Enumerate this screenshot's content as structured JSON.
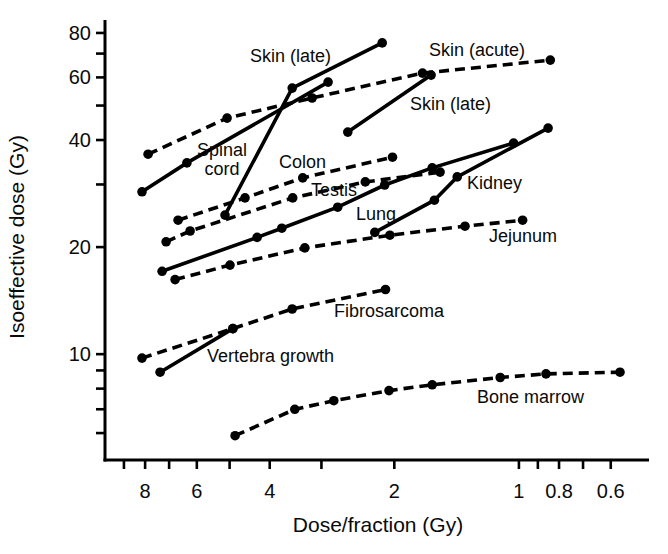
{
  "figure": {
    "background": "#ffffff",
    "ink": "#000000"
  },
  "chart_data": {
    "type": "line",
    "title": "",
    "xlabel": "Dose/fraction (Gy)",
    "ylabel": "Isoeffective dose (Gy)",
    "x_scale": "log",
    "y_scale": "log",
    "x_axis_reversed": true,
    "x_domain": [
      10,
      0.485
    ],
    "y_domain": [
      5.04,
      87.0
    ],
    "grid": false,
    "legend": "none (direct line labels)",
    "x_ticks": [
      {
        "v": 9,
        "label": ""
      },
      {
        "v": 8,
        "label": "8"
      },
      {
        "v": 7,
        "label": ""
      },
      {
        "v": 6,
        "label": "6"
      },
      {
        "v": 5,
        "label": ""
      },
      {
        "v": 4,
        "label": "4"
      },
      {
        "v": 3,
        "label": ""
      },
      {
        "v": 2,
        "label": "2"
      },
      {
        "v": 1,
        "label": "1"
      },
      {
        "v": 0.9,
        "label": ""
      },
      {
        "v": 0.8,
        "label": "0.8"
      },
      {
        "v": 0.7,
        "label": ""
      },
      {
        "v": 0.6,
        "label": "0.6"
      }
    ],
    "y_ticks": [
      {
        "v": 80,
        "label": "80"
      },
      {
        "v": 70,
        "label": ""
      },
      {
        "v": 60,
        "label": "60"
      },
      {
        "v": 50,
        "label": ""
      },
      {
        "v": 40,
        "label": "40"
      },
      {
        "v": 30,
        "label": ""
      },
      {
        "v": 20,
        "label": "20"
      },
      {
        "v": 10,
        "label": "10"
      },
      {
        "v": 9,
        "label": ""
      },
      {
        "v": 8,
        "label": ""
      },
      {
        "v": 7,
        "label": ""
      },
      {
        "v": 6,
        "label": ""
      }
    ],
    "series": [
      {
        "id": "skin-late-steep",
        "name": "Skin (late)",
        "line": "solid",
        "points": [
          [
            5.13,
            24.6
          ],
          [
            3.53,
            56.0
          ],
          [
            2.14,
            75.0
          ]
        ]
      },
      {
        "id": "skin-acute",
        "name": "Skin (acute)",
        "line": "dashed",
        "points": [
          [
            7.87,
            36.5
          ],
          [
            5.07,
            46.1
          ],
          [
            3.16,
            52.5
          ],
          [
            1.71,
            61.7
          ],
          [
            0.84,
            67.1
          ]
        ]
      },
      {
        "id": "skin-late-lower",
        "name": "Skin (late)",
        "line": "solid",
        "points": [
          [
            2.59,
            42.1
          ],
          [
            1.63,
            60.9
          ]
        ]
      },
      {
        "id": "spinal-cord",
        "name": "Spinal cord",
        "line": "solid",
        "points": [
          [
            8.14,
            28.6
          ],
          [
            6.34,
            34.5
          ],
          [
            2.89,
            58.2
          ]
        ]
      },
      {
        "id": "colon",
        "name": "Colon",
        "line": "dashed",
        "points": [
          [
            6.66,
            23.8
          ],
          [
            4.59,
            27.5
          ],
          [
            3.33,
            31.3
          ],
          [
            2.02,
            35.8
          ]
        ]
      },
      {
        "id": "testis",
        "name": "Testis",
        "line": "dashed",
        "points": [
          [
            7.12,
            20.7
          ],
          [
            6.23,
            22.2
          ],
          [
            3.52,
            27.5
          ],
          [
            2.35,
            30.5
          ],
          [
            1.55,
            32.5
          ]
        ]
      },
      {
        "id": "lung",
        "name": "Lung",
        "line": "solid",
        "points": [
          [
            7.28,
            17.1
          ],
          [
            4.29,
            21.3
          ],
          [
            3.74,
            22.6
          ],
          [
            2.74,
            25.9
          ],
          [
            2.11,
            29.9
          ],
          [
            1.62,
            33.4
          ],
          [
            1.03,
            39.2
          ]
        ]
      },
      {
        "id": "kidney",
        "name": "Kidney",
        "line": "solid",
        "points": [
          [
            2.23,
            22.0
          ],
          [
            1.6,
            27.1
          ],
          [
            1.41,
            31.5
          ],
          [
            0.85,
            43.2
          ]
        ]
      },
      {
        "id": "jejunum",
        "name": "Jejunum",
        "line": "dashed",
        "points": [
          [
            6.77,
            16.2
          ],
          [
            4.99,
            17.8
          ],
          [
            3.29,
            19.9
          ],
          [
            2.05,
            21.6
          ],
          [
            1.35,
            22.9
          ],
          [
            0.98,
            23.8
          ]
        ]
      },
      {
        "id": "fibrosarcoma",
        "name": "Fibrosarcoma",
        "line": "dashed",
        "points": [
          [
            8.14,
            9.75
          ],
          [
            4.91,
            11.8
          ],
          [
            3.53,
            13.4
          ],
          [
            2.1,
            15.2
          ]
        ]
      },
      {
        "id": "vertebra-growth",
        "name": "Vertebra growth",
        "line": "solid",
        "points": [
          [
            7.36,
            8.9
          ],
          [
            4.91,
            11.8
          ]
        ]
      },
      {
        "id": "bone-marrow",
        "name": "Bone marrow",
        "line": "dashed",
        "points": [
          [
            4.85,
            5.9
          ],
          [
            3.48,
            7.0
          ],
          [
            2.8,
            7.4
          ],
          [
            2.06,
            7.9
          ],
          [
            1.62,
            8.2
          ],
          [
            1.11,
            8.6
          ],
          [
            0.86,
            8.8
          ],
          [
            0.57,
            8.9
          ]
        ]
      }
    ],
    "annotations": [
      {
        "text": "Skin (late)",
        "px": [
          250,
          62
        ],
        "anchor": "start"
      },
      {
        "text": "Skin (acute)",
        "px": [
          429,
          56
        ],
        "anchor": "start"
      },
      {
        "text": "Skin (late)",
        "px": [
          410,
          110
        ],
        "anchor": "start"
      },
      {
        "text": "Spinal\ncord",
        "px": [
          222,
          156
        ],
        "anchor": "middle"
      },
      {
        "text": "Colon",
        "px": [
          279,
          168
        ],
        "anchor": "start"
      },
      {
        "text": "Testis",
        "px": [
          311,
          196
        ],
        "anchor": "start"
      },
      {
        "text": "Lung",
        "px": [
          356,
          220
        ],
        "anchor": "start"
      },
      {
        "text": "Kidney",
        "px": [
          467,
          189
        ],
        "anchor": "start"
      },
      {
        "text": "Jejunum",
        "px": [
          489,
          242
        ],
        "anchor": "start"
      },
      {
        "text": "Fibrosarcoma",
        "px": [
          334,
          317
        ],
        "anchor": "start"
      },
      {
        "text": "Vertebra growth",
        "px": [
          207,
          362
        ],
        "anchor": "start"
      },
      {
        "text": "Bone marrow",
        "px": [
          477,
          403
        ],
        "anchor": "start"
      }
    ]
  }
}
